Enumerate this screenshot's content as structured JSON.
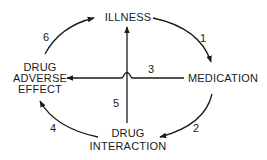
{
  "diagram": {
    "type": "cycle",
    "nodes": {
      "illness": {
        "lines": [
          "ILLNESS"
        ]
      },
      "medication": {
        "lines": [
          "MEDICATION"
        ]
      },
      "drug_interaction": {
        "lines": [
          "DRUG",
          "INTERACTION"
        ]
      },
      "drug_adverse_effect": {
        "lines": [
          "DRUG",
          "ADVERSE",
          "EFFECT"
        ]
      }
    },
    "edges": [
      {
        "id": "1",
        "label": "1",
        "from": "ILLNESS",
        "to": "MEDICATION"
      },
      {
        "id": "2",
        "label": "2",
        "from": "MEDICATION",
        "to": "DRUG INTERACTION"
      },
      {
        "id": "3",
        "label": "3",
        "from": "MEDICATION",
        "to": "DRUG ADVERSE EFFECT"
      },
      {
        "id": "4",
        "label": "4",
        "from": "DRUG INTERACTION",
        "to": "DRUG ADVERSE EFFECT"
      },
      {
        "id": "5",
        "label": "5",
        "from": "DRUG INTERACTION",
        "to": "ILLNESS"
      },
      {
        "id": "6",
        "label": "6",
        "from": "DRUG ADVERSE EFFECT",
        "to": "ILLNESS"
      }
    ],
    "colors": {
      "ink": "#1a1a1a",
      "background": "#ffffff"
    }
  }
}
